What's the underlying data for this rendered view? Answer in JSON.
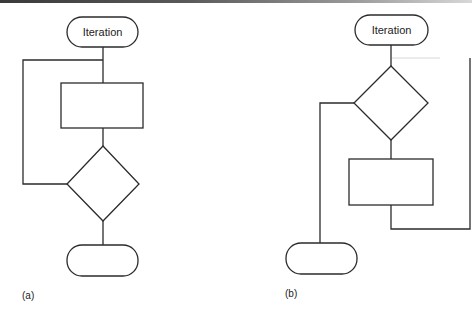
{
  "figure": {
    "panel_a": {
      "caption": "(a)",
      "start_terminal": {
        "label": "Iteration"
      },
      "process_box": {
        "label": ""
      },
      "decision": {
        "label": ""
      },
      "end_terminal": {
        "label": ""
      },
      "structure": "post-test loop: process then decision, loop back above process"
    },
    "panel_b": {
      "caption": "(b)",
      "start_terminal": {
        "label": "Iteration"
      },
      "decision": {
        "label": ""
      },
      "process_box": {
        "label": ""
      },
      "end_terminal": {
        "label": ""
      },
      "structure": "pre-test loop: decision then process, loop back to decision"
    }
  },
  "colors": {
    "stroke": "#2b2b2b",
    "background": "#ffffff"
  }
}
